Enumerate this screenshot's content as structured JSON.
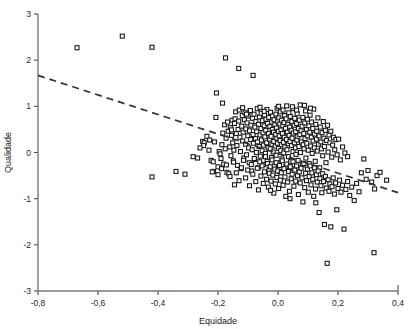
{
  "chart_data": {
    "type": "scatter",
    "title": "",
    "xlabel": "Equidade",
    "ylabel": "Qualidade",
    "xlim": [
      -0.8,
      0.4
    ],
    "ylim": [
      -3,
      3
    ],
    "xticks": [
      -0.8,
      -0.6,
      -0.4,
      -0.2,
      0.0,
      0.2,
      0.4
    ],
    "xtick_labels": [
      "-0,8",
      "-0,6",
      "-0,4",
      "-0,2",
      "0,0",
      "0,2",
      "0,4"
    ],
    "yticks": [
      3,
      2,
      1,
      0,
      -1,
      -2,
      -3
    ],
    "ytick_labels": [
      "3",
      "2",
      "1",
      "0",
      "-1",
      "-2",
      "-3"
    ],
    "grid": false,
    "legend": null,
    "marker": "open-square",
    "marker_color": "#1a1a1a",
    "marker_size": 4,
    "n_points": 402,
    "trendline": {
      "style": "dashed",
      "color": "#333333",
      "x": [
        -0.8,
        0.4
      ],
      "y": [
        1.67,
        -0.87
      ],
      "slope": -2.117,
      "intercept": -0.027
    },
    "points": [
      [
        -0.67,
        2.27
      ],
      [
        -0.519,
        2.52
      ],
      [
        -0.42,
        2.28
      ],
      [
        -0.175,
        2.05
      ],
      [
        -0.131,
        1.82
      ],
      [
        -0.083,
        1.67
      ],
      [
        -0.205,
        1.29
      ],
      [
        -0.185,
        1.07
      ],
      [
        -0.42,
        -0.53
      ],
      [
        -0.34,
        -0.41
      ],
      [
        -0.31,
        -0.47
      ],
      [
        -0.283,
        -0.09
      ],
      [
        -0.251,
        0.24
      ],
      [
        -0.246,
        0.21
      ],
      [
        -0.237,
        0.35
      ],
      [
        -0.228,
        0.27
      ],
      [
        -0.223,
        -0.17
      ],
      [
        -0.216,
        -0.2
      ],
      [
        -0.212,
        0.23
      ],
      [
        -0.207,
        0.76
      ],
      [
        -0.2,
        -0.31
      ],
      [
        -0.196,
        0.02
      ],
      [
        -0.193,
        -0.03
      ],
      [
        -0.19,
        -0.13
      ],
      [
        -0.187,
        0.17
      ],
      [
        -0.184,
        0.42
      ],
      [
        -0.181,
        -0.25
      ],
      [
        -0.178,
        0.6
      ],
      [
        -0.176,
        0.08
      ],
      [
        -0.173,
        0.31
      ],
      [
        -0.17,
        -0.43
      ],
      [
        -0.168,
        0.66
      ],
      [
        -0.166,
        0.46
      ],
      [
        -0.164,
        -0.46
      ],
      [
        -0.161,
        0.12
      ],
      [
        -0.159,
        0.54
      ],
      [
        -0.157,
        -0.07
      ],
      [
        -0.155,
        0.37
      ],
      [
        -0.153,
        0.7
      ],
      [
        -0.151,
        0.21
      ],
      [
        -0.149,
        -0.18
      ],
      [
        -0.147,
        0.05
      ],
      [
        -0.145,
        0.63
      ],
      [
        -0.143,
        0.73
      ],
      [
        -0.141,
        0.88
      ],
      [
        -0.139,
        0.41
      ],
      [
        -0.137,
        0.15
      ],
      [
        -0.135,
        -0.28
      ],
      [
        -0.133,
        0.5
      ],
      [
        -0.131,
        0.68
      ],
      [
        -0.129,
        0.92
      ],
      [
        -0.127,
        0.33
      ],
      [
        -0.125,
        0.02
      ],
      [
        -0.123,
        -0.35
      ],
      [
        -0.121,
        0.57
      ],
      [
        -0.119,
        0.8
      ],
      [
        -0.118,
        0.25
      ],
      [
        -0.116,
        0.44
      ],
      [
        -0.114,
        -0.12
      ],
      [
        -0.112,
        0.71
      ],
      [
        -0.11,
        0.86
      ],
      [
        -0.108,
        0.18
      ],
      [
        -0.107,
        0.51
      ],
      [
        -0.105,
        -0.05
      ],
      [
        -0.103,
        0.64
      ],
      [
        -0.101,
        0.36
      ],
      [
        -0.1,
        0.79
      ],
      [
        -0.098,
        0.1
      ],
      [
        -0.096,
        -0.22
      ],
      [
        -0.095,
        0.47
      ],
      [
        -0.093,
        0.9
      ],
      [
        -0.091,
        0.28
      ],
      [
        -0.09,
        0.59
      ],
      [
        -0.088,
        -0.4
      ],
      [
        -0.086,
        0.06
      ],
      [
        -0.085,
        0.74
      ],
      [
        -0.083,
        0.39
      ],
      [
        -0.082,
        0.2
      ],
      [
        -0.08,
        0.83
      ],
      [
        -0.078,
        -0.15
      ],
      [
        -0.077,
        0.55
      ],
      [
        -0.075,
        0.3
      ],
      [
        -0.074,
        0.67
      ],
      [
        -0.072,
        0.0
      ],
      [
        -0.071,
        0.45
      ],
      [
        -0.069,
        0.95
      ],
      [
        -0.068,
        0.23
      ],
      [
        -0.066,
        -0.33
      ],
      [
        -0.065,
        0.61
      ],
      [
        -0.063,
        0.13
      ],
      [
        -0.062,
        0.77
      ],
      [
        -0.06,
        0.38
      ],
      [
        -0.059,
        -0.08
      ],
      [
        -0.057,
        0.52
      ],
      [
        -0.056,
        0.85
      ],
      [
        -0.055,
        0.27
      ],
      [
        -0.053,
        0.04
      ],
      [
        -0.052,
        0.69
      ],
      [
        -0.05,
        0.43
      ],
      [
        -0.049,
        -0.26
      ],
      [
        -0.048,
        0.16
      ],
      [
        -0.046,
        0.58
      ],
      [
        -0.045,
        0.81
      ],
      [
        -0.044,
        0.34
      ],
      [
        -0.042,
        -0.02
      ],
      [
        -0.041,
        0.48
      ],
      [
        -0.04,
        0.72
      ],
      [
        -0.038,
        0.21
      ],
      [
        -0.037,
        0.93
      ],
      [
        -0.036,
        -0.19
      ],
      [
        -0.035,
        0.63
      ],
      [
        -0.033,
        0.11
      ],
      [
        -0.032,
        0.41
      ],
      [
        -0.031,
        0.76
      ],
      [
        -0.03,
        -0.37
      ],
      [
        -0.028,
        0.29
      ],
      [
        -0.027,
        0.56
      ],
      [
        -0.026,
        0.08
      ],
      [
        -0.025,
        0.87
      ],
      [
        -0.023,
        0.35
      ],
      [
        -0.022,
        -0.11
      ],
      [
        -0.021,
        0.66
      ],
      [
        -0.02,
        0.18
      ],
      [
        -0.019,
        0.5
      ],
      [
        -0.018,
        0.79
      ],
      [
        -0.016,
        0.01
      ],
      [
        -0.015,
        0.44
      ],
      [
        -0.014,
        0.24
      ],
      [
        -0.013,
        0.71
      ],
      [
        -0.012,
        -0.29
      ],
      [
        -0.011,
        0.6
      ],
      [
        -0.009,
        0.14
      ],
      [
        -0.008,
        0.39
      ],
      [
        -0.007,
        0.83
      ],
      [
        -0.006,
        -0.06
      ],
      [
        -0.005,
        0.53
      ],
      [
        -0.004,
        0.31
      ],
      [
        -0.003,
        0.96
      ],
      [
        -0.002,
        0.2
      ],
      [
        -0.001,
        0.68
      ],
      [
        0.0,
        -0.23
      ],
      [
        0.001,
        0.46
      ],
      [
        0.002,
        0.09
      ],
      [
        0.003,
        0.75
      ],
      [
        0.004,
        0.36
      ],
      [
        0.005,
        -0.41
      ],
      [
        0.006,
        0.62
      ],
      [
        0.007,
        0.26
      ],
      [
        0.008,
        0.88
      ],
      [
        0.009,
        0.04
      ],
      [
        0.01,
        0.49
      ],
      [
        0.011,
        0.17
      ],
      [
        0.012,
        0.7
      ],
      [
        0.013,
        -0.14
      ],
      [
        0.015,
        0.41
      ],
      [
        0.016,
        0.58
      ],
      [
        0.017,
        0.92
      ],
      [
        0.018,
        0.22
      ],
      [
        0.019,
        -0.01
      ],
      [
        0.02,
        0.65
      ],
      [
        0.021,
        0.33
      ],
      [
        0.022,
        0.8
      ],
      [
        0.023,
        0.12
      ],
      [
        0.025,
        0.52
      ],
      [
        0.026,
        -0.31
      ],
      [
        0.027,
        0.73
      ],
      [
        0.028,
        0.28
      ],
      [
        0.029,
        1.01
      ],
      [
        0.03,
        0.06
      ],
      [
        0.031,
        0.44
      ],
      [
        0.033,
        0.61
      ],
      [
        0.034,
        0.19
      ],
      [
        0.035,
        -0.09
      ],
      [
        0.036,
        0.86
      ],
      [
        0.037,
        0.37
      ],
      [
        0.039,
        0.55
      ],
      [
        0.04,
        0.24
      ],
      [
        0.041,
        0.78
      ],
      [
        0.042,
        -0.2
      ],
      [
        0.044,
        0.48
      ],
      [
        0.045,
        0.15
      ],
      [
        0.046,
        0.67
      ],
      [
        0.047,
        0.31
      ],
      [
        0.049,
        0.95
      ],
      [
        0.05,
        0.02
      ],
      [
        0.051,
        0.42
      ],
      [
        0.052,
        -0.35
      ],
      [
        0.054,
        0.59
      ],
      [
        0.055,
        0.21
      ],
      [
        0.056,
        0.74
      ],
      [
        0.058,
        0.1
      ],
      [
        0.059,
        0.45
      ],
      [
        0.06,
        -0.04
      ],
      [
        0.062,
        0.63
      ],
      [
        0.063,
        0.27
      ],
      [
        0.064,
        0.84
      ],
      [
        0.066,
        0.35
      ],
      [
        0.067,
        -0.17
      ],
      [
        0.068,
        0.52
      ],
      [
        0.07,
        0.13
      ],
      [
        0.071,
        0.7
      ],
      [
        0.073,
        0.39
      ],
      [
        0.074,
        1.03
      ],
      [
        0.075,
        0.0
      ],
      [
        0.077,
        0.47
      ],
      [
        0.078,
        0.23
      ],
      [
        0.08,
        0.57
      ],
      [
        0.081,
        -0.27
      ],
      [
        0.083,
        0.76
      ],
      [
        0.084,
        0.17
      ],
      [
        0.086,
        0.41
      ],
      [
        0.087,
        0.08
      ],
      [
        0.089,
        0.64
      ],
      [
        0.09,
        0.3
      ],
      [
        0.092,
        0.9
      ],
      [
        0.093,
        -0.12
      ],
      [
        0.095,
        0.5
      ],
      [
        0.096,
        0.2
      ],
      [
        0.098,
        0.72
      ],
      [
        0.099,
        0.36
      ],
      [
        0.101,
        0.05
      ],
      [
        0.103,
        0.58
      ],
      [
        0.104,
        -0.24
      ],
      [
        0.106,
        0.44
      ],
      [
        0.107,
        0.81
      ],
      [
        0.109,
        0.14
      ],
      [
        0.111,
        0.33
      ],
      [
        0.112,
        0.66
      ],
      [
        0.114,
        -0.02
      ],
      [
        0.116,
        0.52
      ],
      [
        0.117,
        0.25
      ],
      [
        0.119,
        0.94
      ],
      [
        0.121,
        0.1
      ],
      [
        0.122,
        0.4
      ],
      [
        0.124,
        -0.19
      ],
      [
        0.126,
        0.61
      ],
      [
        0.128,
        0.29
      ],
      [
        0.129,
        0.46
      ],
      [
        0.131,
        0.03
      ],
      [
        0.133,
        0.75
      ],
      [
        0.135,
        0.18
      ],
      [
        0.137,
        0.36
      ],
      [
        0.139,
        -0.33
      ],
      [
        0.141,
        0.55
      ],
      [
        0.143,
        0.23
      ],
      [
        0.145,
        0.08
      ],
      [
        0.147,
        0.43
      ],
      [
        0.149,
        -0.07
      ],
      [
        0.151,
        0.67
      ],
      [
        0.153,
        0.31
      ],
      [
        0.155,
        0.13
      ],
      [
        0.158,
        0.48
      ],
      [
        0.16,
        -0.22
      ],
      [
        0.162,
        0.26
      ],
      [
        0.165,
        0.59
      ],
      [
        0.167,
        0.01
      ],
      [
        0.17,
        0.38
      ],
      [
        0.173,
        0.21
      ],
      [
        0.176,
        0.46
      ],
      [
        0.179,
        -0.1
      ],
      [
        0.182,
        0.16
      ],
      [
        0.185,
        0.33
      ],
      [
        0.189,
        0.06
      ],
      [
        0.193,
        0.28
      ],
      [
        0.197,
        -0.05
      ],
      [
        0.202,
        0.29
      ],
      [
        0.208,
        -0.16
      ],
      [
        0.215,
        0.12
      ],
      [
        0.223,
        -0.01
      ],
      [
        0.232,
        -0.09
      ],
      [
        -0.215,
        -0.41
      ],
      [
        -0.2,
        -0.48
      ],
      [
        -0.188,
        -0.35
      ],
      [
        -0.172,
        -0.27
      ],
      [
        -0.16,
        -0.52
      ],
      [
        -0.148,
        -0.21
      ],
      [
        -0.139,
        -0.44
      ],
      [
        -0.13,
        -0.61
      ],
      [
        -0.122,
        -0.33
      ],
      [
        -0.115,
        -0.17
      ],
      [
        -0.108,
        -0.55
      ],
      [
        -0.101,
        -0.38
      ],
      [
        -0.095,
        -0.72
      ],
      [
        -0.089,
        -0.26
      ],
      [
        -0.084,
        -0.47
      ],
      [
        -0.079,
        -0.13
      ],
      [
        -0.074,
        -0.63
      ],
      [
        -0.069,
        -0.34
      ],
      [
        -0.065,
        -0.81
      ],
      [
        -0.061,
        -0.2
      ],
      [
        -0.057,
        -0.51
      ],
      [
        -0.053,
        -0.29
      ],
      [
        -0.049,
        -0.67
      ],
      [
        -0.045,
        -0.42
      ],
      [
        -0.042,
        -0.09
      ],
      [
        -0.038,
        -0.58
      ],
      [
        -0.035,
        -0.24
      ],
      [
        -0.032,
        -0.75
      ],
      [
        -0.029,
        -0.45
      ],
      [
        -0.026,
        -0.31
      ],
      [
        -0.023,
        -0.62
      ],
      [
        -0.02,
        -0.16
      ],
      [
        -0.017,
        -0.49
      ],
      [
        -0.014,
        -0.88
      ],
      [
        -0.011,
        -0.36
      ],
      [
        -0.009,
        -0.68
      ],
      [
        -0.006,
        -0.22
      ],
      [
        -0.004,
        -0.54
      ],
      [
        -0.001,
        -0.4
      ],
      [
        0.002,
        -0.78
      ],
      [
        0.005,
        -0.28
      ],
      [
        0.008,
        -0.6
      ],
      [
        0.011,
        -0.44
      ],
      [
        0.014,
        -0.18
      ],
      [
        0.017,
        -0.71
      ],
      [
        0.02,
        -0.35
      ],
      [
        0.023,
        -0.53
      ],
      [
        0.026,
        -0.95
      ],
      [
        0.029,
        -0.25
      ],
      [
        0.032,
        -0.64
      ],
      [
        0.035,
        -0.41
      ],
      [
        0.038,
        -0.84
      ],
      [
        0.041,
        -0.31
      ],
      [
        0.044,
        -0.57
      ],
      [
        0.047,
        -0.47
      ],
      [
        0.05,
        -0.2
      ],
      [
        0.053,
        -0.73
      ],
      [
        0.056,
        -0.38
      ],
      [
        0.059,
        -0.62
      ],
      [
        0.062,
        -0.29
      ],
      [
        0.065,
        -0.5
      ],
      [
        0.068,
        -0.91
      ],
      [
        0.071,
        -0.42
      ],
      [
        0.074,
        -0.66
      ],
      [
        0.077,
        -0.34
      ],
      [
        0.08,
        -0.55
      ],
      [
        0.083,
        -1.07
      ],
      [
        0.086,
        -0.24
      ],
      [
        0.089,
        -0.76
      ],
      [
        0.092,
        -0.45
      ],
      [
        0.095,
        -0.61
      ],
      [
        0.098,
        -0.36
      ],
      [
        0.101,
        -0.86
      ],
      [
        0.104,
        -0.52
      ],
      [
        0.107,
        -0.29
      ],
      [
        0.11,
        -0.7
      ],
      [
        0.113,
        -0.44
      ],
      [
        0.116,
        -0.58
      ],
      [
        0.119,
        -0.95
      ],
      [
        0.122,
        -0.33
      ],
      [
        0.125,
        -0.79
      ],
      [
        0.128,
        -0.48
      ],
      [
        0.131,
        -0.64
      ],
      [
        0.134,
        -0.4
      ],
      [
        0.137,
        -1.3
      ],
      [
        0.14,
        -0.56
      ],
      [
        0.143,
        -0.72
      ],
      [
        0.146,
        -0.87
      ],
      [
        0.149,
        -0.46
      ],
      [
        0.152,
        -0.63
      ],
      [
        0.155,
        -1.56
      ],
      [
        0.158,
        -0.52
      ],
      [
        0.161,
        -0.77
      ],
      [
        0.164,
        -2.4
      ],
      [
        0.167,
        -0.59
      ],
      [
        0.17,
        -0.84
      ],
      [
        0.173,
        -0.68
      ],
      [
        0.176,
        -1.61
      ],
      [
        0.18,
        -0.74
      ],
      [
        0.184,
        -0.55
      ],
      [
        0.188,
        -0.9
      ],
      [
        0.192,
        -0.66
      ],
      [
        0.196,
        -1.24
      ],
      [
        0.2,
        -0.78
      ],
      [
        0.205,
        -0.6
      ],
      [
        0.21,
        -0.86
      ],
      [
        0.215,
        -0.71
      ],
      [
        0.22,
        -1.66
      ],
      [
        0.226,
        -0.8
      ],
      [
        0.232,
        -0.63
      ],
      [
        0.239,
        -0.93
      ],
      [
        0.246,
        -0.75
      ],
      [
        0.254,
        -1.04
      ],
      [
        0.262,
        -0.67
      ],
      [
        0.27,
        -0.85
      ],
      [
        0.278,
        -0.44
      ],
      [
        0.286,
        -0.14
      ],
      [
        0.294,
        -0.58
      ],
      [
        0.3,
        -0.39
      ],
      [
        0.312,
        -0.64
      ],
      [
        0.32,
        -2.17
      ],
      [
        0.322,
        -0.79
      ],
      [
        0.33,
        -0.5
      ],
      [
        0.34,
        -0.43
      ],
      [
        0.362,
        -0.6
      ],
      [
        -0.118,
        0.97
      ],
      [
        -0.105,
        0.83
      ],
      [
        -0.092,
        0.91
      ],
      [
        -0.06,
        0.98
      ],
      [
        -0.046,
        0.89
      ],
      [
        0.002,
        1.0
      ],
      [
        0.048,
        0.99
      ],
      [
        0.062,
        0.92
      ],
      [
        0.088,
        1.02
      ],
      [
        0.108,
        0.96
      ],
      [
        -0.025,
        -0.82
      ],
      [
        0.04,
        -1.0
      ],
      [
        0.126,
        -1.09
      ],
      [
        -0.248,
        0.15
      ],
      [
        -0.26,
        0.1
      ],
      [
        -0.268,
        -0.12
      ],
      [
        -0.145,
        -0.7
      ],
      [
        -0.155,
        0.49
      ],
      [
        -0.23,
        0.05
      ],
      [
        -0.219,
        -0.42
      ]
    ]
  }
}
